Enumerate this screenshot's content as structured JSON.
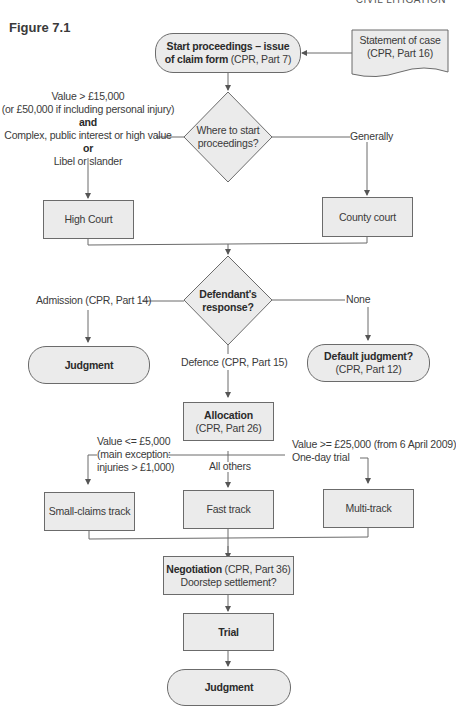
{
  "header": {
    "running_title": "CIVIL LITIGATION"
  },
  "figure": {
    "label": "Figure 7.1"
  },
  "nodes": {
    "start": {
      "bold": "Start proceedings – issue",
      "bold2": "of claim form",
      "normal": "(CPR, Part 7)"
    },
    "statement": {
      "line1": "Statement of case",
      "line2": "(CPR, Part 16)"
    },
    "where": {
      "line1": "Where to start",
      "line2": "proceedings?"
    },
    "high_court": {
      "label": "High Court"
    },
    "county_court": {
      "label": "County court"
    },
    "defendant": {
      "line1": "Defendant's",
      "line2": "response?"
    },
    "judgment_left": {
      "label": "Judgment"
    },
    "default_judgment": {
      "bold": "Default judgment?",
      "normal": "(CPR, Part 12)"
    },
    "allocation": {
      "bold": "Allocation",
      "normal": "(CPR, Part 26)"
    },
    "small_claims": {
      "label": "Small-claims track"
    },
    "fast_track": {
      "label": "Fast track"
    },
    "multi_track": {
      "label": "Multi-track"
    },
    "negotiation": {
      "bold": "Negotiation",
      "normal": "(CPR, Part 36)",
      "line2": "Doorstep settlement?"
    },
    "trial": {
      "label": "Trial"
    },
    "judgment_final": {
      "label": "Judgment"
    }
  },
  "edge_labels": {
    "high_court_criteria": {
      "line1": "Value > £15,000",
      "line2": "(or £50,000 if including personal injury)",
      "and": "and",
      "line3": "Complex, public interest or high value",
      "or": "or",
      "line4": "Libel or slander"
    },
    "generally": "Generally",
    "admission": "Admission (CPR, Part 14)",
    "none": "None",
    "defence": "Defence (CPR, Part 15)",
    "small_claims_criteria": {
      "line1": "Value <= £5,000",
      "line2": "(main exception:",
      "line3": "injuries > £1,000)"
    },
    "all_others": "All others",
    "multi_track_criteria": {
      "line1": "Value >= £25,000 (from 6 April 2009)",
      "line2": "One-day trial"
    }
  },
  "colors": {
    "fill": "#ebebeb",
    "stroke": "#6b6b6b",
    "text": "#3a3a3a"
  }
}
